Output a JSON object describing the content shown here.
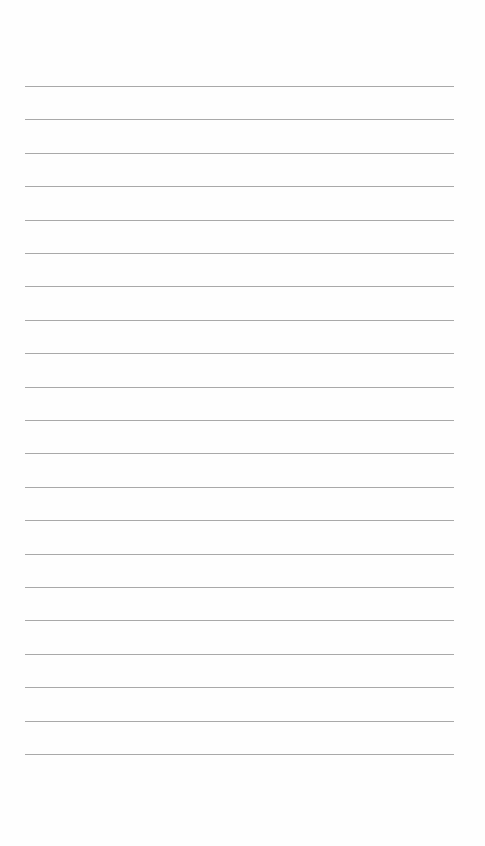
{
  "document": {
    "type": "lined-paper",
    "line_count": 21,
    "line_color": "#a9a9a9",
    "background_color": "#fefefe",
    "text": ""
  }
}
